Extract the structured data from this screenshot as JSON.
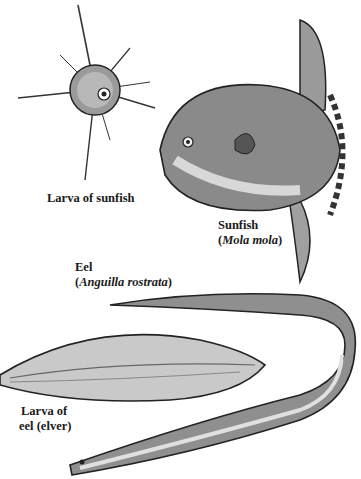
{
  "illustration": {
    "subjects": [
      {
        "id": "larva-sunfish",
        "label": "Larva of sunfish"
      },
      {
        "id": "sunfish",
        "label": "Sunfish",
        "scientific_name": "Mola mola"
      },
      {
        "id": "eel",
        "label": "Eel",
        "scientific_name": "Anguilla rostrata"
      },
      {
        "id": "larva-eel",
        "label_line1": "Larva of",
        "label_line2": "eel (elver)"
      }
    ]
  },
  "colors": {
    "ink": "#1a1a1a",
    "shade": "#8a8a8a",
    "light": "#d8d8d8",
    "background": "#ffffff"
  }
}
